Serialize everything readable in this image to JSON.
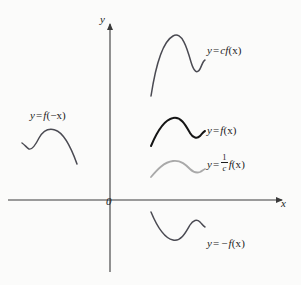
{
  "figure": {
    "kind": "math-graph",
    "background_color": "#fbfbfa",
    "axis_color": "#3a3a3a",
    "origin_label": "0"
  },
  "axes": {
    "x_label": "x",
    "y_label": "y",
    "x_axis": {
      "x1": 8,
      "y1": 200,
      "x2": 288,
      "y2": 200,
      "arrow": "right"
    },
    "y_axis": {
      "x1": 110,
      "y1": 272,
      "x2": 110,
      "y2": 18,
      "arrow": "up"
    }
  },
  "labels": {
    "cfx": {
      "lhs": "y",
      "op": "=",
      "rhs_prefix": "c",
      "fn": "f",
      "arg": "(x)",
      "full_text": "y = cf(x)"
    },
    "fx": {
      "lhs": "y",
      "op": "=",
      "rhs_prefix": "",
      "fn": "f",
      "arg": "(x)",
      "full_text": "y = f(x)"
    },
    "oneoverc": {
      "lhs": "y",
      "op": "=",
      "num": "1",
      "den": "c",
      "fn": "f",
      "arg": "(x)",
      "full_text": "y = 1/c f(x)"
    },
    "negfx": {
      "lhs": "y",
      "op": "=",
      "rhs_prefix": "−",
      "fn": "f",
      "arg": "(x)",
      "full_text": "y = −f(x)"
    },
    "fnegx": {
      "lhs": "y",
      "op": "=",
      "fn": "f",
      "arg": "(−x)",
      "full_text": "y = f(−x)"
    }
  },
  "chart_data": {
    "type": "line",
    "title": "",
    "xlabel": "x",
    "ylabel": "y",
    "grid": false,
    "legend": "inline-annotations",
    "origin_px": {
      "x": 110,
      "y": 200
    },
    "xlim_px": [
      8,
      288
    ],
    "ylim_px": [
      18,
      272
    ],
    "series": [
      {
        "name": "y = cf(x)",
        "color": "#4a4a52",
        "width": 1.5,
        "path": "M 151,96 C 155,70 162,42 173,36 C 182,31 187,48 191,62 C 194,72 197,74 200,69 C 202,65 203,61 205,60"
      },
      {
        "name": "y = f(x)",
        "color": "#151515",
        "width": 2.0,
        "path": "M 151,146 C 156,134 163,120 173,118 C 181,116 186,126 190,133 C 193,138 197,139 200,136 C 202,134 203,132 205,131"
      },
      {
        "name": "y = (1/c) f(x)",
        "color": "#a9a9a9",
        "width": 1.8,
        "path": "M 151,177 C 157,170 164,162 173,161 C 181,160 186,165 190,169 C 193,172 197,173 200,172 C 202,171 203,170 205,169"
      },
      {
        "name": "y = −f(x)",
        "color": "#4a4a52",
        "width": 1.5,
        "path": "M 151,212 C 156,224 163,238 173,240 C 181,242 186,232 190,225 C 193,220 197,219 200,222 C 202,224 203,226 205,227"
      },
      {
        "name": "y = f(−x)",
        "color": "#4a4a52",
        "width": 1.5,
        "path": "M 22,143 C 25,145 27,148 29,149 C 32,150 36,144 39,138 C 43,131 49,128 55,130 C 65,133 72,150 77,164"
      }
    ]
  }
}
